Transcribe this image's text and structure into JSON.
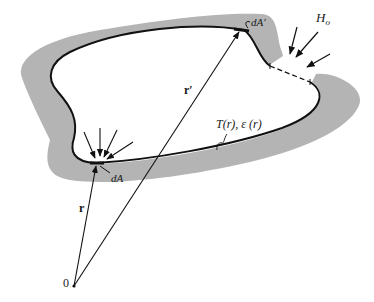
{
  "figure": {
    "colors": {
      "background": "#ffffff",
      "wall_fill": "#b4b4b4",
      "line": "#111111"
    },
    "labels": {
      "origin": "0",
      "r": "r",
      "r_prime": "r′",
      "dA": "dA",
      "dA_prime": "dA′",
      "external_irradiation": "H",
      "external_irradiation_sub": "o",
      "surface_props": "T(r), ε (r)"
    },
    "points": {
      "origin": [
        74,
        286
      ],
      "dA": [
        96,
        163
      ],
      "dA_prime": [
        240,
        30
      ]
    }
  }
}
